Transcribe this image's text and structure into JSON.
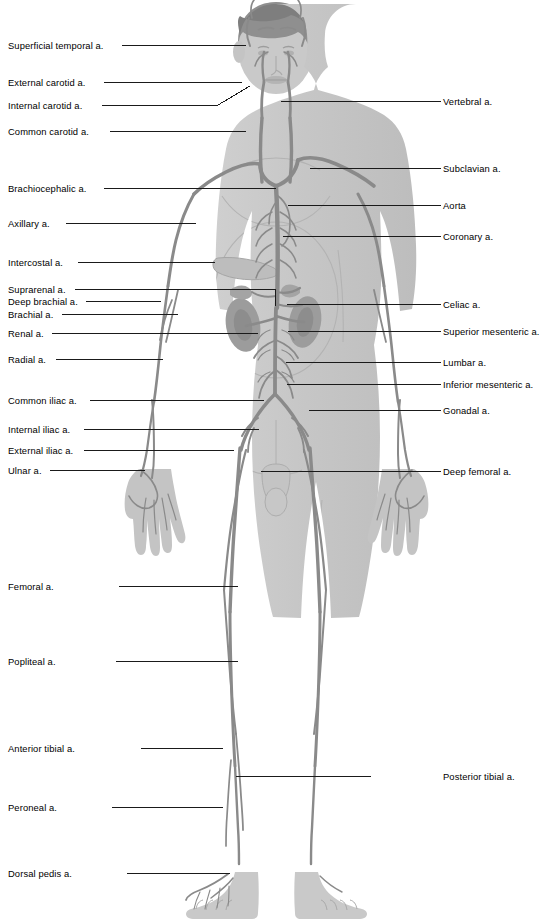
{
  "figure": {
    "colors": {
      "background": "#ffffff",
      "body_fill": "#c9c9c9",
      "body_fill_light": "#d4d4d4",
      "body_outline": "#a8a8a8",
      "hair": "#8f8f8f",
      "vessel": "#8a8a8a",
      "vessel_dark": "#767676",
      "organ": "#9a9a9a",
      "leader_line": "#1a1a1a",
      "label_text": "#000000"
    }
  },
  "labels_left": [
    {
      "id": "superficial-temporal-a",
      "text": "Superficial temporal a.",
      "y": 41,
      "line_end_x": 246,
      "line_y": 45
    },
    {
      "id": "external-carotid-a",
      "text": "External carotid a.",
      "y": 78,
      "line_end_x": 242,
      "line_y": 82
    },
    {
      "id": "internal-carotid-a",
      "text": "Internal carotid a.",
      "y": 101,
      "line_end_x": 218,
      "line_y": 105,
      "kind": "diagonal",
      "tip_x": 250,
      "tip_y": 86
    },
    {
      "id": "common-carotid-a",
      "text": "Common carotid a.",
      "y": 127,
      "line_end_x": 246,
      "line_y": 131
    },
    {
      "id": "brachiocephalic-a",
      "text": "Brachiocephalic a.",
      "y": 184,
      "line_end_x": 276,
      "line_y": 188
    },
    {
      "id": "axillary-a",
      "text": "Axillary a.",
      "y": 219,
      "line_end_x": 196,
      "line_y": 223
    },
    {
      "id": "intercostal-a",
      "text": "Intercostal a.",
      "y": 258,
      "line_end_x": 215,
      "line_y": 262
    },
    {
      "id": "suprarenal-a",
      "text": "Suprarenal a.",
      "y": 285,
      "line_end_x": 275,
      "line_y": 289,
      "kind": "elbow",
      "drop_y": 306
    },
    {
      "id": "deep-brachial-a",
      "text": "Deep brachial a.",
      "y": 297,
      "line_end_x": 161,
      "line_y": 301
    },
    {
      "id": "brachial-a",
      "text": "Brachial a.",
      "y": 310,
      "line_end_x": 178,
      "line_y": 314
    },
    {
      "id": "renal-a",
      "text": "Renal a.",
      "y": 329,
      "line_end_x": 258,
      "line_y": 333
    },
    {
      "id": "radial-a",
      "text": "Radial a.",
      "y": 355,
      "line_end_x": 163,
      "line_y": 359
    },
    {
      "id": "common-iliac-a",
      "text": "Common iliac a.",
      "y": 396,
      "line_end_x": 264,
      "line_y": 400
    },
    {
      "id": "internal-iliac-a",
      "text": "Internal iliac a.",
      "y": 425,
      "line_end_x": 259,
      "line_y": 429
    },
    {
      "id": "external-iliac-a",
      "text": "External iliac a.",
      "y": 446,
      "line_end_x": 234,
      "line_y": 450
    },
    {
      "id": "ulnar-a",
      "text": "Ulnar a.",
      "y": 466,
      "line_end_x": 145,
      "line_y": 470
    },
    {
      "id": "femoral-a",
      "text": "Femoral a.",
      "y": 582,
      "line_end_x": 238,
      "line_y": 586
    },
    {
      "id": "popliteal-a",
      "text": "Popliteal a.",
      "y": 657,
      "line_end_x": 238,
      "line_y": 661
    },
    {
      "id": "anterior-tibial-a",
      "text": "Anterior tibial a.",
      "y": 744,
      "line_end_x": 223,
      "line_y": 748
    },
    {
      "id": "peroneal-a",
      "text": "Peroneal a.",
      "y": 803,
      "line_end_x": 223,
      "line_y": 807
    },
    {
      "id": "dorsal-pedis-a",
      "text": "Dorsal pedis a.",
      "y": 869,
      "line_end_x": 230,
      "line_y": 873
    }
  ],
  "labels_right": [
    {
      "id": "vertebral-a",
      "text": "Vertebral a.",
      "y": 97,
      "line_start_x": 281,
      "line_y": 101
    },
    {
      "id": "subclavian-a",
      "text": "Subclavian a.",
      "y": 164,
      "line_start_x": 310,
      "line_y": 168
    },
    {
      "id": "aorta",
      "text": "Aorta",
      "y": 201,
      "line_start_x": 288,
      "line_y": 205
    },
    {
      "id": "coronary-a",
      "text": "Coronary a.",
      "y": 232,
      "line_start_x": 283,
      "line_y": 236
    },
    {
      "id": "celiac-a",
      "text": "Celiac a.",
      "y": 300,
      "line_start_x": 287,
      "line_y": 304
    },
    {
      "id": "superior-mesenteric-a",
      "text": "Superior mesenteric a.",
      "y": 327,
      "line_start_x": 288,
      "line_y": 331
    },
    {
      "id": "lumbar-a",
      "text": "Lumbar a.",
      "y": 358,
      "line_start_x": 286,
      "line_y": 362
    },
    {
      "id": "inferior-mesenteric-a",
      "text": "Inferior mesenteric a.",
      "y": 380,
      "line_start_x": 287,
      "line_y": 384
    },
    {
      "id": "gonadal-a",
      "text": "Gonadal a.",
      "y": 406,
      "line_start_x": 309,
      "line_y": 410
    },
    {
      "id": "deep-femoral-a",
      "text": "Deep femoral a.",
      "y": 467,
      "line_start_x": 261,
      "line_y": 471
    },
    {
      "id": "posterior-tibial-a",
      "text": "Posterior tibial a.",
      "y": 772,
      "line_start_x": 236,
      "line_y": 776
    }
  ]
}
